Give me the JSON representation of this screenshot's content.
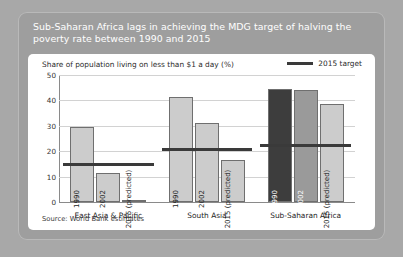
{
  "figure": {
    "title": "Sub-Saharan Africa lags in achieving the MDG target of halving the poverty rate between 1990 and 2015",
    "source": "Source: World Bank estimates",
    "colors": {
      "outer_background": "#a8a8a8",
      "card_background": "#9e9e9e",
      "panel_background": "#ffffff",
      "title_text": "#ffffff",
      "bar_light": "#cccccc",
      "bar_medium": "#9a9a9a",
      "bar_dark": "#3d3d3d",
      "target_line": "#3a3a3a",
      "gridline": "#d2d2d2"
    }
  },
  "chart_data": {
    "type": "bar",
    "title": "Share of population living on less than $1 a day (%)",
    "xlabel": "",
    "ylabel": "",
    "ylim": [
      0,
      50
    ],
    "yticks": [
      0,
      10,
      20,
      30,
      40,
      50
    ],
    "grid": true,
    "legend": {
      "position": "top-right",
      "entries": [
        {
          "label": "2015 target",
          "marker": "line",
          "color": "#3a3a3a"
        }
      ]
    },
    "categories": [
      "East Asia & Pacific",
      "South Asia",
      "Sub-Saharan Africa"
    ],
    "series": [
      {
        "name": "1990",
        "values": [
          29.5,
          41.3,
          44.6
        ]
      },
      {
        "name": "2002",
        "values": [
          11.6,
          31.2,
          44.0
        ]
      },
      {
        "name": "2015 (predicted)",
        "values": [
          0.9,
          16.7,
          38.4
        ]
      }
    ],
    "target_line_values": [
      14.8,
      20.7,
      22.3
    ],
    "bar_labels": [
      "1990",
      "2002",
      "2015 (predicted)"
    ]
  }
}
